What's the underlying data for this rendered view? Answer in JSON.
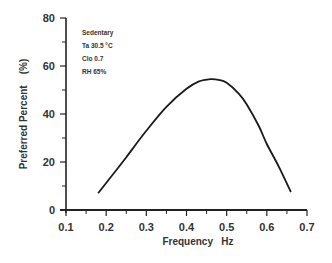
{
  "chart_data": {
    "type": "line",
    "title": "",
    "xlabel": "Frequency   Hz",
    "ylabel": "Preferred Percent    (%)",
    "xlim": [
      0.1,
      0.7
    ],
    "ylim": [
      0,
      80
    ],
    "xticks": [
      "0.1",
      "0.2",
      "0.3",
      "0.4",
      "0.5",
      "0.6",
      "0.7"
    ],
    "yticks": [
      "0",
      "20",
      "40",
      "60",
      "80"
    ],
    "grid": false,
    "legend": null,
    "annotations": [
      "Sedentary",
      "Ta    30.5 °C",
      "Clo   0.7",
      "RH   65%"
    ],
    "series": [
      {
        "name": "Preferred Percent",
        "x": [
          0.18,
          0.22,
          0.25,
          0.3,
          0.35,
          0.4,
          0.43,
          0.46,
          0.48,
          0.5,
          0.53,
          0.55,
          0.58,
          0.6,
          0.63,
          0.66
        ],
        "y": [
          7,
          15.5,
          22,
          33,
          43,
          50.5,
          53.5,
          54.5,
          54.2,
          53,
          48.5,
          44,
          35,
          27.5,
          18,
          7.5
        ]
      }
    ]
  },
  "annotation_box": {
    "line1": "Sedentary",
    "line2": "Ta    30.5 °C",
    "line3": "Clo   0.7",
    "line4": "RH   65%"
  },
  "axes": {
    "xlabel": "Frequency   Hz",
    "ylabel": "Preferred Percent    (%)"
  }
}
